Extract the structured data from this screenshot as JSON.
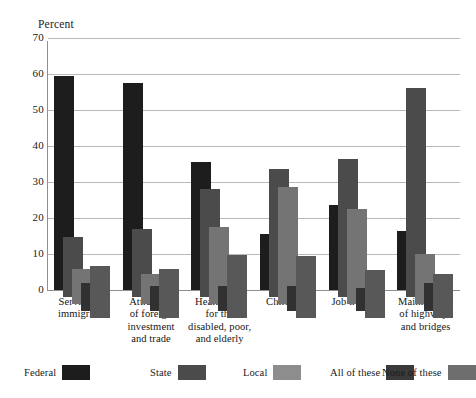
{
  "chart_data": {
    "type": "bar",
    "title": "",
    "subtitle": "",
    "xlabel": "",
    "ylabel": "Percent",
    "ylim": [
      0,
      70
    ],
    "ytick_labels": [
      "70",
      "60",
      "50",
      "40",
      "30",
      "20",
      "10",
      "0"
    ],
    "ytick_values": [
      70,
      60,
      50,
      40,
      30,
      20,
      10,
      0
    ],
    "grid": true,
    "legend_position": "bottom",
    "categories": [
      "Services to immigrants",
      "Attraction of foreign investment and trade",
      "Health care for the disabled, poor, and elderly",
      "Child care",
      "Job training",
      "Maintenance of highways and bridges"
    ],
    "category_label_lines": [
      [
        "Services to",
        "immigrants"
      ],
      [
        "Attraction",
        "of foreign",
        "investment",
        "and trade"
      ],
      [
        "Health care",
        "for the",
        "disabled, poor,",
        "and elderly"
      ],
      [
        "Child care"
      ],
      [
        "Job training"
      ],
      [
        "Maintenance",
        "of highways",
        "and bridges"
      ]
    ],
    "series": [
      {
        "name": "Federal",
        "color": "#1d1d1d",
        "values": [
          59.5,
          57.5,
          35.5,
          15.5,
          23.5,
          16.5
        ]
      },
      {
        "name": "State",
        "color": "#4b4b4b",
        "values": [
          14.8,
          17.0,
          28.0,
          33.5,
          36.5,
          56.0
        ]
      },
      {
        "name": "Local",
        "color": "#747474",
        "values": [
          5.8,
          4.5,
          17.5,
          28.5,
          22.5,
          10.0
        ]
      },
      {
        "name": "All of these",
        "color": "#313131",
        "values": [
          2.0,
          1.0,
          1.2,
          1.2,
          0.5,
          2.0
        ]
      },
      {
        "name": "None of these",
        "color": "#585858",
        "values": [
          6.8,
          5.8,
          9.8,
          9.5,
          5.5,
          4.5
        ]
      }
    ]
  },
  "legend": {
    "entries": [
      {
        "label": "Federal",
        "color": "#1d1d1d"
      },
      {
        "label": "State",
        "color": "#4b4b4b"
      },
      {
        "label": "Local",
        "color": "#8d8d8d"
      },
      {
        "label": "All of these",
        "color": "#3a3a3a"
      },
      {
        "label": "None of these",
        "color": "#6e6e6e"
      }
    ]
  },
  "axis": {
    "y_title": "Percent"
  }
}
